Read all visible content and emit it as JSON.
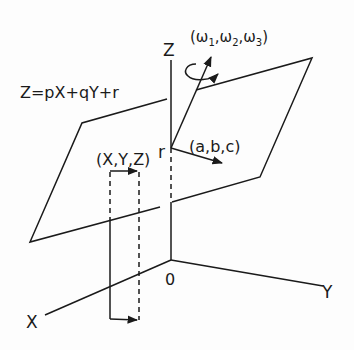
{
  "diagram": {
    "equation": "Z=pX+qY+r",
    "axes": {
      "z_label": "Z",
      "x_label": "X",
      "y_label": "Y",
      "origin_label": "0"
    },
    "point_label": "r",
    "point_coords_label": "(X,Y,Z)",
    "translation_vector_label": "(a,b,c)",
    "rotation_vector_label": "(ω1, ω2, ω3)",
    "rotation_parts": {
      "open": "(",
      "w": "ω",
      "s1": "1",
      "s2": "2",
      "s3": "3",
      "comma": ",",
      "close": ")"
    },
    "colors": {
      "ink": "#1a1a1a",
      "background": "#fdfdfd"
    }
  }
}
